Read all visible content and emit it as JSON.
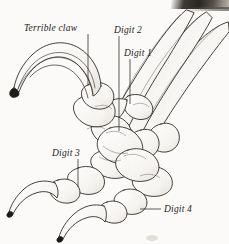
{
  "figure": {
    "background_color": "#fbfaf8",
    "ink_color": "#1c1a18",
    "width": 229,
    "height": 244
  },
  "labels": [
    {
      "id": "terrible-claw",
      "text": "Terrible claw",
      "x": 24,
      "y": 24
    },
    {
      "id": "digit-2",
      "text": "Digit 2",
      "x": 114,
      "y": 26
    },
    {
      "id": "digit-1",
      "text": "Digit 1",
      "x": 124,
      "y": 49
    },
    {
      "id": "digit-3",
      "text": "Digit 3",
      "x": 52,
      "y": 149
    },
    {
      "id": "digit-4",
      "text": "Digit 4",
      "x": 164,
      "y": 205
    }
  ],
  "leader_lines": [
    {
      "id": "leader-terrible-claw",
      "from": [
        88,
        34
      ],
      "to": [
        88,
        86
      ]
    },
    {
      "id": "leader-digit-2",
      "from": [
        119,
        36
      ],
      "to": [
        119,
        131
      ]
    },
    {
      "id": "leader-digit-1",
      "from": [
        130,
        59
      ],
      "to": [
        130,
        104
      ]
    },
    {
      "id": "leader-digit-3",
      "from": [
        78,
        159
      ],
      "to": [
        78,
        187
      ]
    },
    {
      "id": "leader-digit-4",
      "from": [
        140,
        209
      ],
      "to": [
        161,
        209
      ]
    }
  ],
  "artifacts": {
    "corner_smudge": "top-right-dark-scan-edge",
    "watermark_note": "faint-diagonal-watermark"
  }
}
